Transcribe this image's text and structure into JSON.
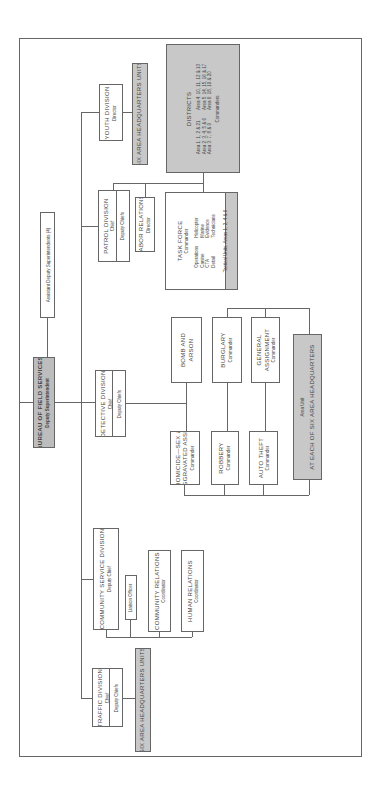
{
  "bureau": {
    "title": "BUREAU OF FIELD SERVICES",
    "subtitle": "Deputy Superintendent"
  },
  "assistant": {
    "title": "Assistant Deputy Superintendents (4)"
  },
  "youth": {
    "title": "YOUTH DIVISION",
    "subtitle": "Director"
  },
  "six_area_top": {
    "title": "SIX AREA HEADQUARTERS UNITS"
  },
  "patrol": {
    "title": "PATROL DIVISION",
    "subtitle": "Chief",
    "sub2": "Deputy Chiefs"
  },
  "labor": {
    "title": "LABOR RELATIONS",
    "subtitle": "Director"
  },
  "task_force": {
    "title": "TASK FORCE",
    "subtitle": "Commander",
    "units": [
      "Operations",
      "Helicopter",
      "Canine",
      "Marine",
      "CTA",
      "Evidence",
      "Detail",
      "Technicians"
    ],
    "footer": "Tactical Units, Areas 1, 2, 4 & 6"
  },
  "districts": {
    "title": "DISTRICTS",
    "rows": [
      "Area 1: 1, 2 & 21",
      "Area 4: 10, 11, 12 & 13",
      "Area 2: 3, 4, 5 & 6",
      "Area 5: 14, 15, 16 & 17",
      "Area 3: 7, 8 & 9",
      "Area 6: 18, 19 & 20"
    ],
    "footer": "Commanders"
  },
  "detective": {
    "title": "DETECTIVE DIVISION",
    "subtitle": "Chief",
    "sub2": "Deputy Chiefs"
  },
  "homicide": {
    "title": "HOMICIDE—SEX &",
    "title2": "AGGRAVATED ASSLT",
    "subtitle": "Commander"
  },
  "bomb": {
    "title": "BOMB AND",
    "title2": "ARSON"
  },
  "robbery": {
    "title": "ROBBERY",
    "subtitle": "Commander"
  },
  "burglary": {
    "title": "BURGLARY",
    "subtitle": "Commander"
  },
  "auto_theft": {
    "title": "AUTO THEFT",
    "subtitle": "Commander"
  },
  "general": {
    "title": "GENERAL",
    "title2": "ASSIGNMENT",
    "subtitle": "Commander"
  },
  "area_unit": {
    "subtitle": "Area Unit",
    "title": "AT EACH OF SIX AREA HEADQUARTERS"
  },
  "community_service": {
    "title": "COMMUNITY SERVICE DIVISION",
    "subtitle": "Deputy Chief"
  },
  "liaison": {
    "title": "Liaison Officer"
  },
  "community_relations": {
    "title": "COMMUNITY RELATIONS",
    "subtitle": "Coordinator"
  },
  "human_relations": {
    "title": "HUMAN RELATIONS",
    "subtitle": "Coordinator"
  },
  "traffic": {
    "title": "TRAFFIC DIVISION",
    "subtitle": "Chief",
    "sub2": "Deputy Chiefs"
  },
  "six_area_bottom": {
    "title": "SIX AREA HEADQUARTERS UNITS"
  }
}
